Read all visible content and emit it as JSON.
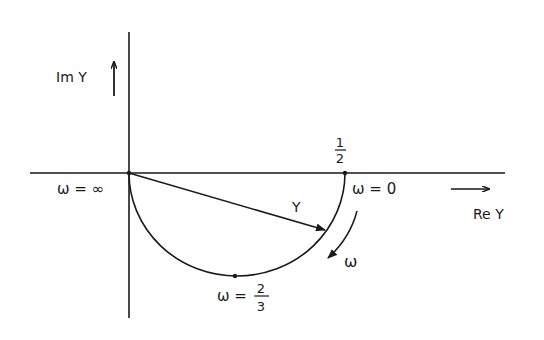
{
  "diagram": {
    "type": "polar-locus",
    "axes": {
      "imag_label": "Im Y",
      "real_label": "Re Y"
    },
    "points": {
      "origin_label": "ω = ∞",
      "end_label": "ω = 0",
      "end_value_num": "1",
      "end_value_den": "2",
      "bottom_label_prefix": "ω =",
      "bottom_value_num": "2",
      "bottom_value_den": "3"
    },
    "vector_label": "Y",
    "direction_label": "ω",
    "colors": {
      "ink": "#1a1a1a",
      "background": "#ffffff"
    }
  }
}
